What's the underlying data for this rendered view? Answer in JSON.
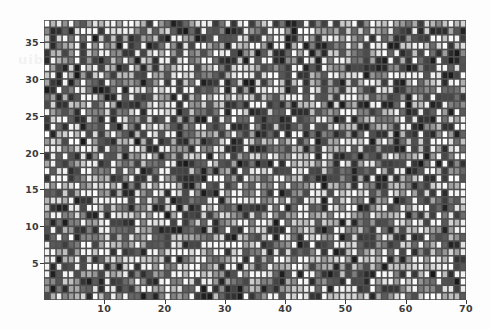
{
  "figure": {
    "type": "heatmap-plot",
    "background_color": "#fdfdfd",
    "watermark_text": "uib",
    "grid_line_color": "#4f4f4f",
    "axis_text_color": "#3b3b3b"
  },
  "chart_data": {
    "type": "heatmap",
    "title": "",
    "subtitle": "",
    "xlabel": "",
    "ylabel": "",
    "n_cols": 70,
    "n_rows": 38,
    "xlim": [
      0,
      70
    ],
    "ylim": [
      0,
      38
    ],
    "grid": true,
    "legend": "none",
    "colormap": "grayscale",
    "colormap_low": "#111111",
    "colormap_high": "#ffffff",
    "value_range": [
      0,
      1
    ],
    "xticks": [
      10,
      20,
      30,
      40,
      50,
      60,
      70
    ],
    "xtick_labels": [
      "10",
      "20",
      "30",
      "40",
      "50",
      "60",
      "70"
    ],
    "yticks": [
      5,
      10,
      15,
      20,
      25,
      30,
      35
    ],
    "ytick_labels": [
      "5",
      "10",
      "15",
      "20",
      "25",
      "30",
      "35"
    ],
    "cell_width_px": 6.03,
    "cell_height_px": 7.37,
    "seed": 20240517,
    "noise_model": "uniform-random-gray"
  }
}
